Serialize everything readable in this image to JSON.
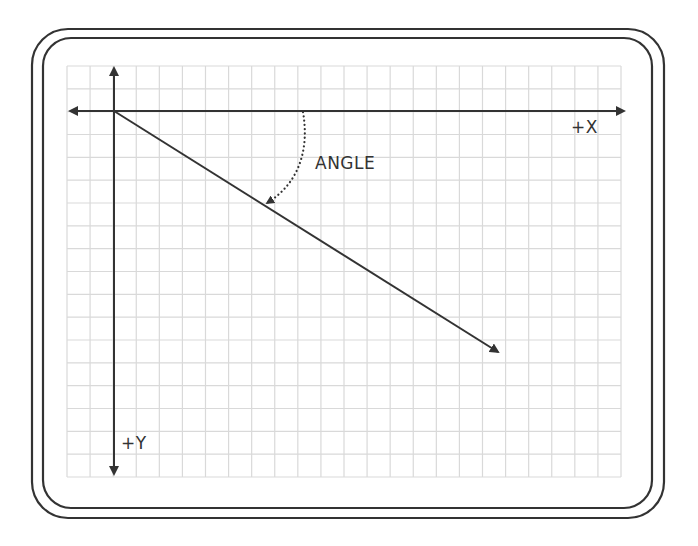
{
  "diagram": {
    "title": "",
    "labels": {
      "x_axis": "+X",
      "y_axis": "+Y",
      "angle": "ANGLE"
    },
    "colors": {
      "background": "#ffffff",
      "frame": "#333333",
      "grid": "#d9d9d9",
      "axis": "#333333",
      "text": "#333333"
    },
    "frame": {
      "outer": {
        "x": 32,
        "y": 29,
        "width": 632,
        "height": 489,
        "radius": 36
      },
      "inner": {
        "x": 43,
        "y": 38,
        "width": 609,
        "height": 470,
        "radius": 28
      }
    },
    "grid": {
      "x": 67,
      "y": 66,
      "width": 554,
      "height": 411,
      "cell": 23.1
    },
    "origin": {
      "x": 114,
      "y": 111
    },
    "x_axis": {
      "from": 70,
      "to": 624
    },
    "y_axis": {
      "from": 68,
      "to": 474
    },
    "vector": {
      "from": [
        114,
        111
      ],
      "to": [
        498,
        352
      ]
    },
    "angle_arc": {
      "start": [
        303,
        112
      ],
      "end": [
        267,
        203
      ]
    }
  }
}
